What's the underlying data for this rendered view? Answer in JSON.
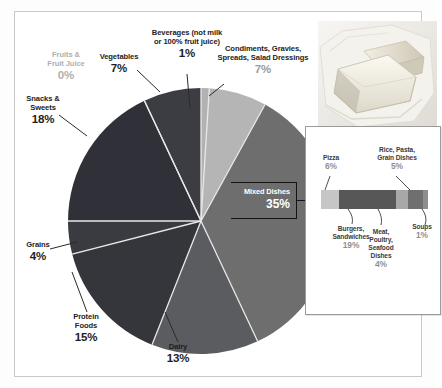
{
  "chart_data": {
    "type": "pie",
    "title": "",
    "categories": [
      "Beverages (not milk or 100% fruit juice)",
      "Condiments, Gravies, Spreads, Salad Dressings",
      "Mixed Dishes",
      "Dairy",
      "Protein Foods",
      "Grains",
      "Snacks & Sweets",
      "Fruits & Fruit Juice",
      "Vegetables"
    ],
    "values": [
      1,
      7,
      35,
      13,
      15,
      4,
      18,
      0,
      7
    ],
    "unit": "%",
    "legend_position": "callout-labels",
    "slices": [
      {
        "label": "Beverages (not milk or 100% fruit juice)",
        "value": 1,
        "value_text": "1%",
        "color": "#b2b2b2"
      },
      {
        "label": "Condiments, Gravies, Spreads, Salad Dressings",
        "value": 7,
        "value_text": "7%",
        "color": "#b5b5b5"
      },
      {
        "label": "Mixed Dishes",
        "value": 35,
        "value_text": "35%",
        "color": "#6e6e6e"
      },
      {
        "label": "Dairy",
        "value": 13,
        "value_text": "13%",
        "color": "#5b5c60"
      },
      {
        "label": "Protein Foods",
        "value": 15,
        "value_text": "15%",
        "color": "#35363c"
      },
      {
        "label": "Grains",
        "value": 4,
        "value_text": "4%",
        "color": "#3a3b41"
      },
      {
        "label": "Snacks & Sweets",
        "value": 18,
        "value_text": "18%",
        "color": "#303138"
      },
      {
        "label": "Fruits & Fruit Juice",
        "value": 0,
        "value_text": "0%",
        "color": "#cfcfcf"
      },
      {
        "label": "Vegetables",
        "value": 7,
        "value_text": "7%",
        "color": "#3c3d43"
      }
    ]
  },
  "labels": {
    "beverages": {
      "line1": "Beverages (not milk",
      "line2": "or 100% fruit juice)",
      "pct": "1%"
    },
    "condiments": {
      "line1": "Condiments, Gravies,",
      "line2": "Spreads, Salad Dressings",
      "pct": "7%"
    },
    "vegetables": {
      "line1": "Vegetables",
      "pct": "7%"
    },
    "fruits": {
      "line1": "Fruits &",
      "line2": "Fruit Juice",
      "pct": "0%"
    },
    "snacks": {
      "line1": "Snacks &",
      "line2": "Sweets",
      "pct": "18%"
    },
    "grains": {
      "line1": "Grains",
      "pct": "4%"
    },
    "protein": {
      "line1": "Protein",
      "line2": "Foods",
      "pct": "15%"
    },
    "dairy": {
      "line1": "Dairy",
      "pct": "13%"
    },
    "mixed": {
      "name": "Mixed Dishes",
      "pct": "35%"
    }
  },
  "inset": {
    "chart_data": {
      "type": "bar",
      "orientation": "horizontal-stacked",
      "title": "Mixed Dishes breakdown",
      "categories": [
        "Pizza",
        "Burgers, Sandwiches",
        "Meat, Poultry, Seafood Dishes",
        "Rice, Pasta, Grain Dishes",
        "Soups"
      ],
      "values": [
        6,
        19,
        4,
        5,
        1
      ],
      "unit": "%"
    },
    "segments": [
      {
        "label": "Pizza",
        "value": 6,
        "value_text": "6%",
        "color": "#c6c6c6"
      },
      {
        "label": "Burgers, Sandwiches",
        "value": 19,
        "value_text": "19%",
        "color": "#575757"
      },
      {
        "label": "Meat, Poultry, Seafood Dishes",
        "value": 4,
        "value_text": "4%",
        "color": "#a8a8a8"
      },
      {
        "label": "Rice, Pasta, Grain Dishes",
        "value": 5,
        "value_text": "5%",
        "color": "#6f6f6f"
      },
      {
        "label": "Soups",
        "value": 1,
        "value_text": "1%",
        "color": "#8d8d8d"
      }
    ],
    "pizza": {
      "line1": "Pizza",
      "pct": "6%"
    },
    "rice": {
      "line1": "Rice, Pasta,",
      "line2": "Grain Dishes",
      "pct": "5%"
    },
    "burgers": {
      "line1": "Burgers,",
      "line2": "Sandwiches",
      "pct": "19%"
    },
    "meat": {
      "line1": "Meat,",
      "line2": "Poultry,",
      "line3": "Seafood",
      "line4": "Dishes",
      "pct": "4%"
    },
    "soups": {
      "line1": "Soups",
      "pct": "1%"
    }
  },
  "photo": {
    "alt": "butter-sticks-photo"
  },
  "colors": {
    "frame_border": "#c9c9c9",
    "inset_border": "#9a9a9a",
    "text": "#1d1d1d",
    "muted_text": "#b0b0b0",
    "semi_text": "#9a9a9a",
    "leader": "#2a2a2a"
  }
}
